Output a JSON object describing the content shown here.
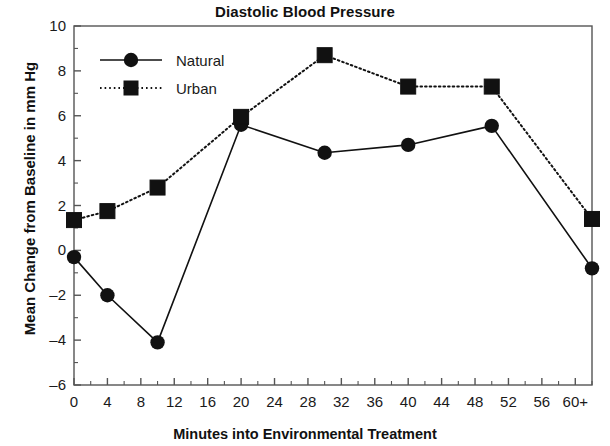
{
  "chart_data": {
    "type": "line",
    "title": "Diastolic Blood Pressure",
    "xlabel": "Minutes into Environmental Treatment",
    "ylabel": "Mean Change from Baseline in mm Hg",
    "xlim": [
      0,
      62
    ],
    "ylim": [
      -6,
      10
    ],
    "ytick_step": 2,
    "xtick_step": 4,
    "xminor_step": 2,
    "grid": false,
    "legend_position": "upper-left",
    "xticklabels": [
      "0",
      "4",
      "8",
      "12",
      "16",
      "20",
      "24",
      "28",
      "32",
      "36",
      "40",
      "44",
      "48",
      "52",
      "56",
      "60+"
    ],
    "xtickvalues": [
      0,
      4,
      8,
      12,
      16,
      20,
      24,
      28,
      32,
      36,
      40,
      44,
      48,
      52,
      56,
      60
    ],
    "yticklabels": [
      "10",
      "8",
      "6",
      "4",
      "2",
      "0",
      "–2",
      "–4",
      "–6"
    ],
    "ytickvalues": [
      10,
      8,
      6,
      4,
      2,
      0,
      -2,
      -4,
      -6
    ],
    "x": [
      0,
      4,
      10,
      20,
      30,
      40,
      50,
      62
    ],
    "series": [
      {
        "name": "Natural",
        "marker": "circle",
        "linestyle": "solid",
        "color": "#111111",
        "values": [
          -0.3,
          -2.0,
          -4.1,
          5.6,
          4.35,
          4.7,
          5.55,
          -0.8
        ]
      },
      {
        "name": "Urban",
        "marker": "square",
        "linestyle": "dotted",
        "color": "#111111",
        "values": [
          1.35,
          1.75,
          2.8,
          5.95,
          8.7,
          7.3,
          7.3,
          1.4
        ]
      }
    ]
  },
  "legend": {
    "items": [
      {
        "label": "Natural"
      },
      {
        "label": "Urban"
      }
    ]
  },
  "colors": {
    "axis": "#555555",
    "ink": "#111111",
    "background": "#ffffff"
  }
}
